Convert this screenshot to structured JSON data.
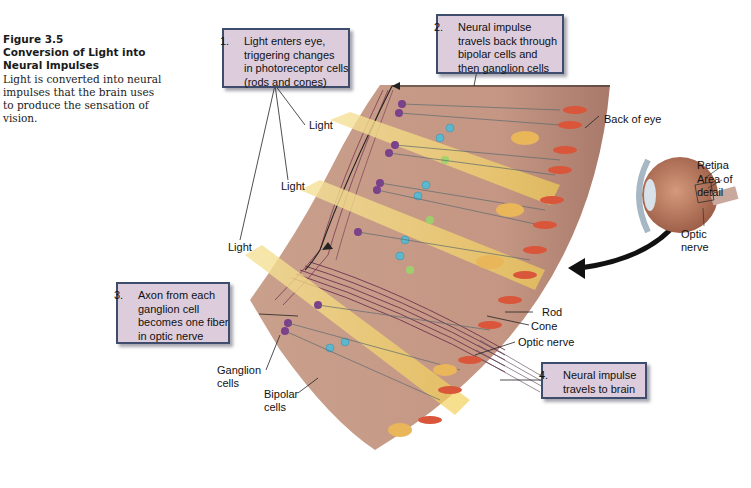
{
  "caption": {
    "figure_number": "Figure 3.5",
    "title_line1": "Conversion of Light into",
    "title_line2": "Neural Impulses",
    "body_lines": [
      "Light is converted into neural",
      "impulses that the brain uses",
      "to produce the sensation of",
      "vision."
    ]
  },
  "callouts": [
    {
      "number": "1.",
      "lines": [
        "Light enters eye,",
        "triggering changes",
        "in photoreceptor cells",
        "(rods and cones)"
      ]
    },
    {
      "number": "2.",
      "lines": [
        "Neural impulse",
        "travels back through",
        "bipolar cells and",
        "then ganglion cells"
      ]
    },
    {
      "number": "3.",
      "lines": [
        "Axon from each",
        "ganglion cell",
        "becomes one fiber",
        "in optic nerve"
      ]
    },
    {
      "number": "4.",
      "lines": [
        "Neural impulse",
        "travels to brain"
      ]
    }
  ],
  "labels": {
    "light_1": "Light",
    "light_2": "Light",
    "light_3": "Light",
    "back_of_eye": "Back of eye",
    "rod": "Rod",
    "cone": "Cone",
    "optic_nerve": "Optic nerve",
    "ganglion_line1": "Ganglion",
    "ganglion_line2": "cells",
    "bipolar_line1": "Bipolar",
    "bipolar_line2": "cells",
    "retina": "Retina",
    "area_line1": "Area of",
    "area_line2": "detail",
    "optic_small_line1": "Optic",
    "optic_small_line2": "nerve"
  },
  "colors": {
    "callout_fill": "#dcccdc",
    "callout_border": "#3e4d6e",
    "retina_tissue": "#c49a84",
    "light_beam": "#f3dc82",
    "ganglion_cell": "#7b3f8c",
    "bipolar_cell": "#5bb8cf",
    "rod_cone": "#d9563a",
    "cone_body": "#e9b65a"
  }
}
